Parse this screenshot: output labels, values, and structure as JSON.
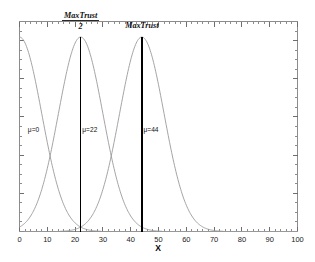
{
  "chart_data": {
    "type": "line",
    "title": "",
    "xlabel": "X",
    "ylabel": "",
    "xlim": [
      0,
      100
    ],
    "ylim": [
      0,
      1.08
    ],
    "grid": false,
    "legend": "none",
    "xticks": [
      "0",
      "10",
      "20",
      "30",
      "40",
      "50",
      "60",
      "70",
      "80",
      "90",
      "100"
    ],
    "xtick_values": [
      0,
      10,
      20,
      30,
      40,
      50,
      60,
      70,
      80,
      90,
      100
    ],
    "xtick_minor_step": 2,
    "yticks": [],
    "series": [
      {
        "name": "mu=0",
        "label": "μ=0",
        "distribution": "gaussian",
        "mean": 0,
        "sigma": 8,
        "peak": 1.0,
        "color": "#9a9a9a",
        "label_x": 3,
        "label_y": 0.52
      },
      {
        "name": "mu=22",
        "label": "μ=22",
        "distribution": "gaussian",
        "mean": 22,
        "sigma": 8,
        "peak": 1.0,
        "color": "#9a9a9a",
        "label_x": 22.6,
        "label_y": 0.52
      },
      {
        "name": "mu=44",
        "label": "μ=44",
        "distribution": "gaussian",
        "mean": 44,
        "sigma": 8,
        "peak": 1.0,
        "color": "#9a9a9a",
        "label_x": 44.6,
        "label_y": 0.52
      }
    ],
    "vertical_lines": [
      {
        "name": "maxtrust-half-line",
        "x": 22,
        "y_top": 1.0,
        "y_bottom": 0,
        "color": "#000000",
        "annotation_numerator": "MaxTrust",
        "annotation_denominator": "2",
        "annotation_is_fraction": true
      },
      {
        "name": "maxtrust-line",
        "x": 44,
        "y_top": 1.0,
        "y_bottom": 0,
        "color": "#000000",
        "annotation_numerator": "MaxTrust",
        "annotation_denominator": "",
        "annotation_is_fraction": false
      }
    ],
    "annotations": [
      {
        "text": "MaxTrust",
        "x": 22,
        "role": "fraction-numerator"
      },
      {
        "text": "2",
        "x": 22,
        "role": "fraction-denominator"
      },
      {
        "text": "MaxTrust",
        "x": 44,
        "role": "plain"
      },
      {
        "text": "μ=0",
        "x": 3,
        "role": "series-label"
      },
      {
        "text": "μ=22",
        "x": 22.6,
        "role": "series-label"
      },
      {
        "text": "μ=44",
        "x": 44.6,
        "role": "series-label"
      }
    ]
  },
  "figure": {
    "background_color": "#ffffff",
    "frame_color": "#8c8c8c",
    "curve_color": "#9a9a9a",
    "line_color": "#000000"
  }
}
